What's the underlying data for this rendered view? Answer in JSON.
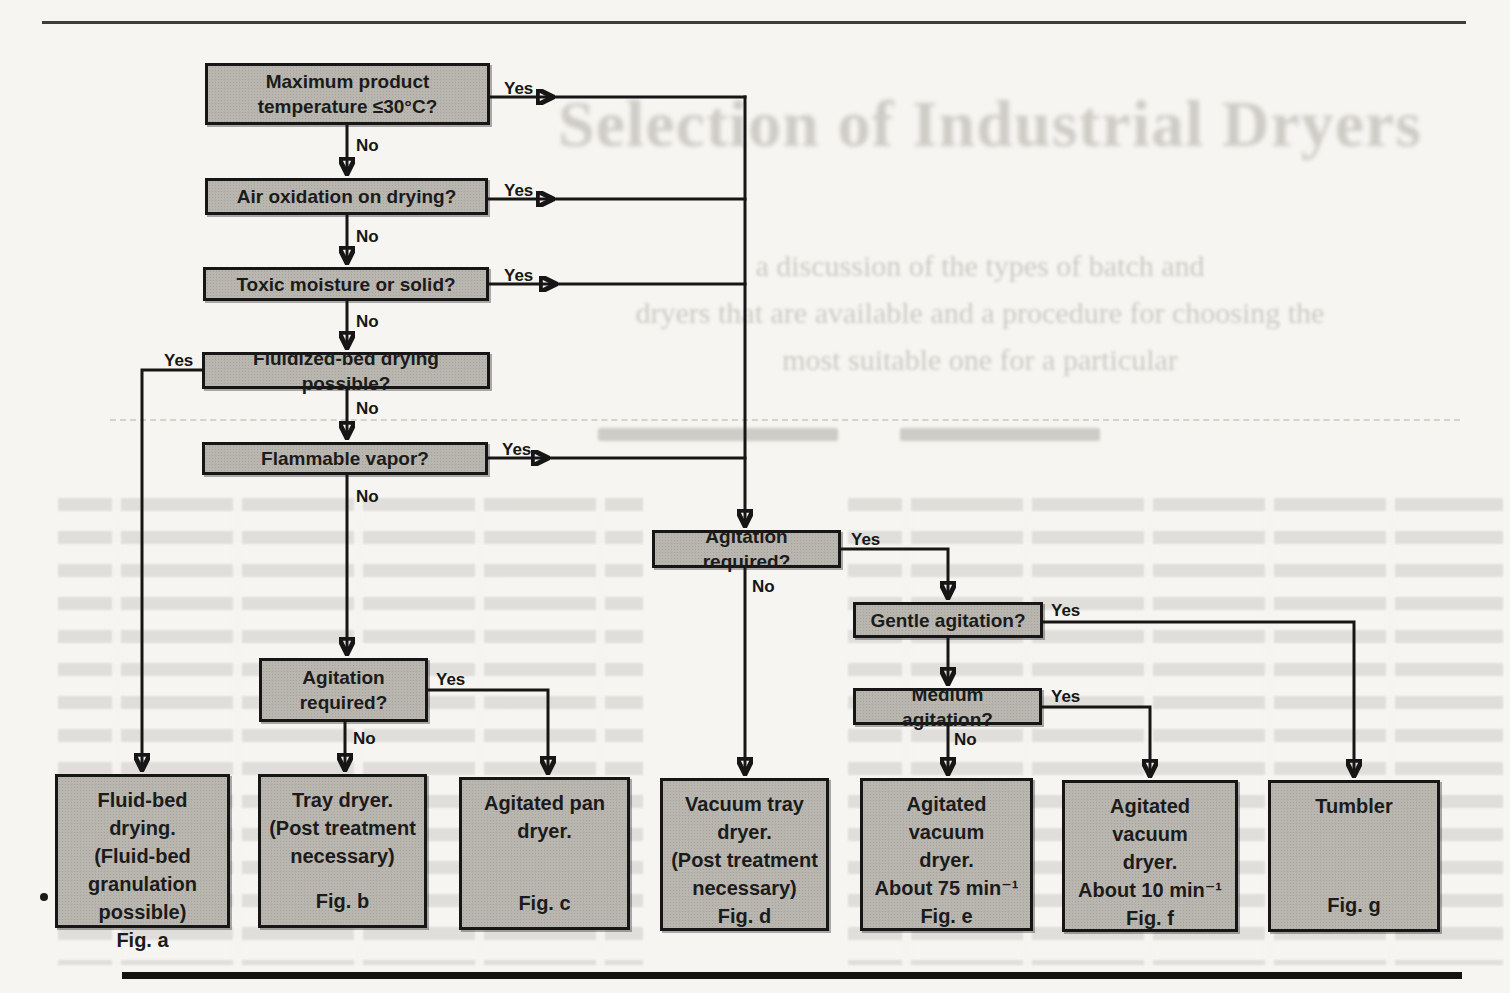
{
  "labels": {
    "yes": "Yes",
    "no": "No"
  },
  "ghost": {
    "title": "Selection of Industrial Dryers",
    "subtitle_lines": "a discussion of the types of batch and\ndryers that are available and a procedure for choosing the\nmost suitable one for a particular"
  },
  "questions": {
    "q1": "Maximum product temperature ≤30°C?",
    "q2": "Air oxidation on drying?",
    "q3": "Toxic moisture or solid?",
    "q4": "Fluidized-bed drying possible?",
    "q5": "Flammable vapor?",
    "ql": "Agitation required?",
    "qr": "Agitation required?",
    "qg": "Gentle agitation?",
    "qm": "Medium agitation?"
  },
  "outcomes": {
    "a": {
      "main": "Fluid-bed drying.\n(Fluid-bed\ngranulation\npossible)",
      "fig": "Fig. a"
    },
    "b": {
      "main": "Tray dryer.\n(Post treatment\nnecessary)",
      "fig": "Fig. b"
    },
    "c": {
      "main": "Agitated pan\ndryer.",
      "fig": "Fig. c"
    },
    "d": {
      "main": "Vacuum tray\ndryer.\n(Post treatment\nnecessary)",
      "fig": "Fig. d"
    },
    "e": {
      "main": "Agitated vacuum\ndryer.\nAbout 75 min⁻¹",
      "fig": "Fig. e"
    },
    "f": {
      "main": "Agitated vacuum\ndryer.\nAbout 10 min⁻¹",
      "fig": "Fig. f"
    },
    "g": {
      "main": "Tumbler",
      "fig": "Fig. g"
    }
  },
  "edges": [
    {
      "from": "q1",
      "yes": "qr",
      "no": "q2"
    },
    {
      "from": "q2",
      "yes": "qr",
      "no": "q3"
    },
    {
      "from": "q3",
      "yes": "qr",
      "no": "q4"
    },
    {
      "from": "q4",
      "yes": "a",
      "no": "q5"
    },
    {
      "from": "q5",
      "yes": "qr",
      "no": "ql"
    },
    {
      "from": "ql",
      "yes": "c",
      "no": "b"
    },
    {
      "from": "qr",
      "yes": "qg",
      "no": "d"
    },
    {
      "from": "qg",
      "yes": "g",
      "no": "qm"
    },
    {
      "from": "qm",
      "yes": "f",
      "no": "e"
    }
  ],
  "colors": {
    "page_bg": "#f6f5f1",
    "box_fill": "#b9b6b0",
    "box_border": "#161616",
    "line": "#161616",
    "ghost_text": "#c8c5bf"
  }
}
